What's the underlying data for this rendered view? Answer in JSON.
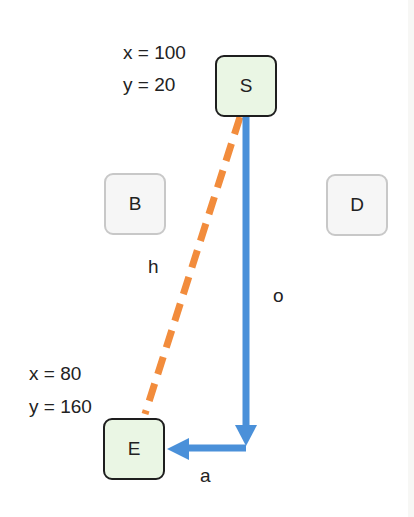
{
  "colors": {
    "hypotenuse": "#f28c3c",
    "path": "#4a90d9",
    "key_node_fill": "#eaf6e4",
    "key_node_border": "#1e1e1e",
    "minor_node_fill": "#f6f6f6",
    "minor_node_border": "#c8c8c8"
  },
  "nodes": {
    "S": {
      "label": "S",
      "coord_x": "x = 100",
      "coord_y": "y = 20"
    },
    "B": {
      "label": "B"
    },
    "D": {
      "label": "D"
    },
    "E": {
      "label": "E",
      "coord_x": "x = 80",
      "coord_y": "y = 160"
    }
  },
  "edges": {
    "hypotenuse": {
      "label": "h",
      "style": "dashed"
    },
    "opposite": {
      "label": "o",
      "style": "solid-arrow"
    },
    "adjacent": {
      "label": "a",
      "style": "solid-arrow"
    }
  }
}
